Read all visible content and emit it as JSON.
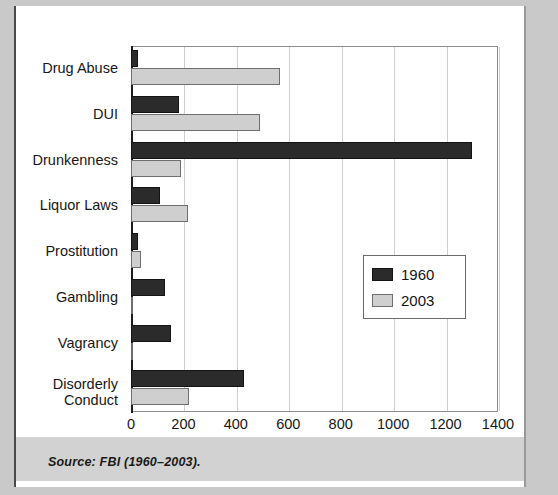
{
  "figure": {
    "source_note": "Source: FBI (1960–2003)."
  },
  "chart_data": {
    "type": "bar",
    "orientation": "horizontal",
    "title": "",
    "subtitle": "",
    "xlabel": "",
    "ylabel": "",
    "xlim": [
      0,
      1400
    ],
    "xticks": [
      0,
      200,
      400,
      600,
      800,
      1000,
      1200,
      1400
    ],
    "xtick_labels": [
      "0",
      "200",
      "400",
      "600",
      "800",
      "1000",
      "1200",
      "1400"
    ],
    "grid": true,
    "grid_axis": "x",
    "legend_position": "center-right",
    "categories": [
      "Drug Abuse",
      "DUI",
      "Drunkenness",
      "Liquor Laws",
      "Prostitution",
      "Gambling",
      "Vagrancy",
      "Disorderly\nConduct"
    ],
    "series": [
      {
        "name": "1960",
        "color": "#2b2b2b",
        "values": [
          25,
          185,
          1300,
          110,
          28,
          128,
          152,
          430
        ]
      },
      {
        "name": "2003",
        "color": "#cfcfcf",
        "values": [
          568,
          492,
          190,
          218,
          38,
          4,
          8,
          222
        ]
      }
    ]
  },
  "legend": {
    "items": [
      {
        "label": "1960",
        "swatch": "dark-swatch"
      },
      {
        "label": "2003",
        "swatch": "light-swatch"
      }
    ]
  },
  "axis": {
    "category_labels": [
      {
        "line1": "Drug Abuse",
        "line2": ""
      },
      {
        "line1": "DUI",
        "line2": ""
      },
      {
        "line1": "Drunkenness",
        "line2": ""
      },
      {
        "line1": "Liquor Laws",
        "line2": ""
      },
      {
        "line1": "Prostitution",
        "line2": ""
      },
      {
        "line1": "Gambling",
        "line2": ""
      },
      {
        "line1": "Vagrancy",
        "line2": ""
      },
      {
        "line1": "Disorderly",
        "line2": "Conduct"
      }
    ]
  },
  "colors": {
    "series_1960": "#2b2b2b",
    "series_2003": "#cfcfcf",
    "background": "#ffffff",
    "page": "#c9c9c9",
    "grid": "#cfcfcf"
  }
}
